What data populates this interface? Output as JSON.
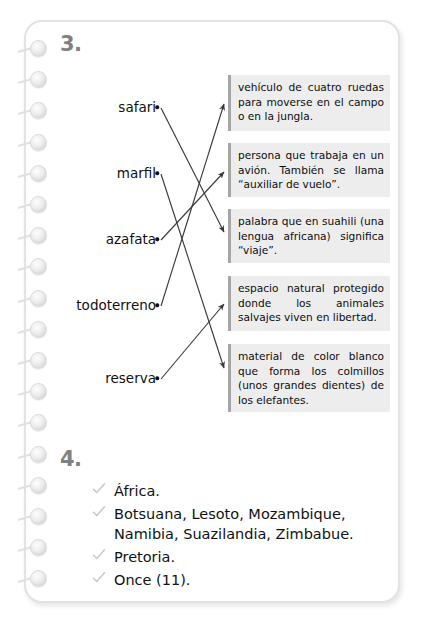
{
  "page": {
    "type": "notebook-answer-key-page",
    "ring_count": 18
  },
  "exercise3": {
    "number": "3.",
    "words": [
      {
        "id": "safari",
        "label": "safari"
      },
      {
        "id": "marfil",
        "label": "marfil"
      },
      {
        "id": "azafata",
        "label": "azafata"
      },
      {
        "id": "todoterreno",
        "label": "todoterreno"
      },
      {
        "id": "reserva",
        "label": "reserva"
      }
    ],
    "definitions": [
      {
        "id": "def1",
        "text": "vehículo de cuatro ruedas para moverse en el campo o en la jungla."
      },
      {
        "id": "def2",
        "text": "persona que trabaja en un avión. También se llama “auxiliar de vuelo”."
      },
      {
        "id": "def3",
        "text": "palabra que en suahili (una lengua africana) significa “viaje”."
      },
      {
        "id": "def4",
        "text": "espacio natural protegido donde los animales salvajes viven en libertad."
      },
      {
        "id": "def5",
        "text": "material de color blanco que forma los colmillos (unos grandes dientes) de los elefantes."
      }
    ],
    "matches": [
      {
        "from": "safari",
        "to": "def3"
      },
      {
        "from": "marfil",
        "to": "def5"
      },
      {
        "from": "azafata",
        "to": "def2"
      },
      {
        "from": "todoterreno",
        "to": "def1"
      },
      {
        "from": "reserva",
        "to": "def4"
      }
    ]
  },
  "exercise4": {
    "number": "4.",
    "items": [
      {
        "check": "check-icon",
        "text": "África."
      },
      {
        "check": "check-icon",
        "text": "Botsuana, Lesoto, Mozambique, Namibia, Suazilandia, Zimbabue."
      },
      {
        "check": "check-icon",
        "text": "Pretoria."
      },
      {
        "check": "check-icon",
        "text": "Once (11)."
      }
    ]
  },
  "colors": {
    "box_background": "#ededed",
    "box_border": "#a6a6a6",
    "number_gray": "#808080",
    "check_gray": "#c9c9c9",
    "page_border": "#e3e3e3",
    "connector_line": "#3a3a3a"
  }
}
